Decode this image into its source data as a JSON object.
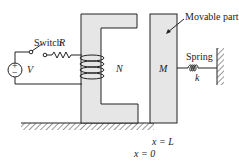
{
  "diagram": {
    "labels": {
      "switch": "Switch",
      "resistor": "R",
      "source": "V",
      "source_plus": "+",
      "source_minus": "−",
      "turns": "N",
      "mass": "M",
      "movable_part": "Movable part",
      "spring": "Spring",
      "spring_constant": "k",
      "x_L": "x = L",
      "x_0": "x = 0"
    },
    "colors": {
      "stroke": "#222222",
      "core_fill": "#e6e6e6",
      "background": "#ffffff"
    }
  }
}
